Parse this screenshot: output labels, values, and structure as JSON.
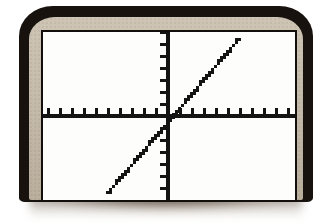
{
  "device": {
    "name": "graphing-calculator",
    "bezel_outer_color": "#17120e",
    "bezel_inner_color": "#c6bcac",
    "screen_color": "#fdfdfb",
    "ink_color": "#141414"
  },
  "screen": {
    "label": "calculator-graph-screen",
    "width_px": 252,
    "height_px": 168
  },
  "chart_data": {
    "type": "line",
    "title": "",
    "subtitle": "",
    "xlabel": "",
    "ylabel": "",
    "legend": [],
    "grid": false,
    "axes": {
      "origin_x_px": 125,
      "origin_y_px": 84,
      "x_axis_visible": true,
      "y_axis_visible": true,
      "tick_spacing_px": 12,
      "tick_length_px": 6,
      "x_tick_count": 20,
      "y_tick_count": 13
    },
    "xlim": [
      -10.4,
      10.6
    ],
    "ylim": [
      -7,
      7
    ],
    "equation": "y = x",
    "slope": 1,
    "intercept": 0,
    "x": [
      -6.9,
      -6,
      -5,
      -4,
      -3,
      -2,
      -1,
      0,
      1,
      2,
      3,
      4,
      5,
      6,
      7,
      8,
      9
    ],
    "y": [
      -6.9,
      -6,
      -5,
      -4,
      -3,
      -2,
      -1,
      0,
      1,
      2,
      3,
      4,
      5,
      6,
      7,
      8,
      9
    ],
    "series": [
      {
        "name": "Y1 = X",
        "values": [
          -6.9,
          -6,
          -5,
          -4,
          -3,
          -2,
          -1,
          0,
          1,
          2,
          3,
          4,
          5,
          6,
          7,
          8,
          9
        ],
        "style": "pixelated-solid",
        "color": "#141414"
      }
    ],
    "line_endpoints_px": {
      "start": [
        64,
        159
      ],
      "end": [
        194,
        6
      ]
    },
    "annotations": []
  }
}
